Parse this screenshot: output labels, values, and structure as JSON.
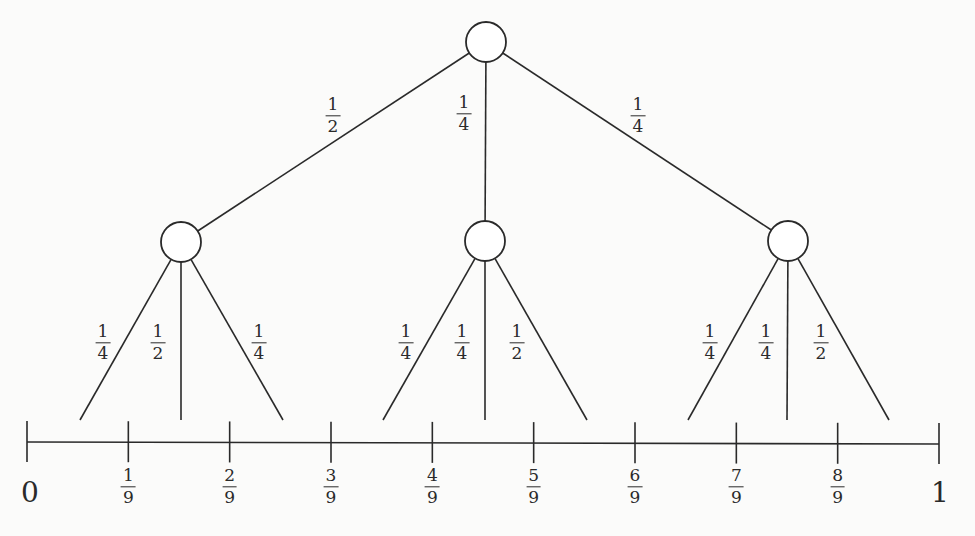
{
  "diagram": {
    "title": "",
    "root": {
      "id": "root",
      "children": [
        {
          "edge_label": {
            "num": "1",
            "den": "2"
          },
          "id": "left",
          "children": [
            {
              "edge_label": {
                "num": "1",
                "den": "4"
              }
            },
            {
              "edge_label": {
                "num": "1",
                "den": "2"
              }
            },
            {
              "edge_label": {
                "num": "1",
                "den": "4"
              }
            }
          ]
        },
        {
          "edge_label": {
            "num": "1",
            "den": "4"
          },
          "id": "middle",
          "children": [
            {
              "edge_label": {
                "num": "1",
                "den": "4"
              }
            },
            {
              "edge_label": {
                "num": "1",
                "den": "4"
              }
            },
            {
              "edge_label": {
                "num": "1",
                "den": "2"
              }
            }
          ]
        },
        {
          "edge_label": {
            "num": "1",
            "den": "4"
          },
          "id": "right",
          "children": [
            {
              "edge_label": {
                "num": "1",
                "den": "4"
              }
            },
            {
              "edge_label": {
                "num": "1",
                "den": "4"
              }
            },
            {
              "edge_label": {
                "num": "1",
                "den": "2"
              }
            }
          ]
        }
      ]
    },
    "number_line": {
      "start_label": "0",
      "end_label": "1",
      "divisions": 9,
      "tick_labels": [
        {
          "num": "1",
          "den": "9"
        },
        {
          "num": "2",
          "den": "9"
        },
        {
          "num": "3",
          "den": "9"
        },
        {
          "num": "4",
          "den": "9"
        },
        {
          "num": "5",
          "den": "9"
        },
        {
          "num": "6",
          "den": "9"
        },
        {
          "num": "7",
          "den": "9"
        },
        {
          "num": "8",
          "den": "9"
        }
      ]
    }
  }
}
